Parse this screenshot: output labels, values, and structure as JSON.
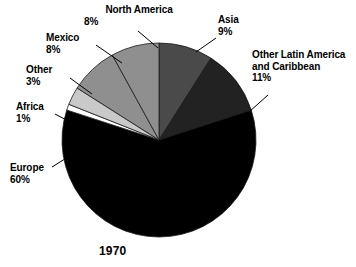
{
  "chart_data": {
    "type": "pie",
    "title": "1970",
    "xlabel": "",
    "ylabel": "",
    "legend_position": "none",
    "grid": false,
    "start_angle_deg": 0,
    "direction": "clockwise",
    "categories": [
      "Asia",
      "Other Latin America and Caribbean",
      "Europe",
      "Africa",
      "Other",
      "Mexico",
      "North America"
    ],
    "values": [
      9,
      11,
      60,
      1,
      3,
      8,
      8
    ],
    "value_unit": "%",
    "colors": [
      "#4a4a4a",
      "#222222",
      "#000000",
      "#ffffff",
      "#c9c9c9",
      "#8f8f8f",
      "#8f8f8f"
    ],
    "slices": [
      {
        "name": "Asia",
        "label_line1": "Asia",
        "label_line2": "",
        "value": 9,
        "value_label": "9%",
        "color": "#4a4a4a"
      },
      {
        "name": "Other Latin America and Caribbean",
        "label_line1": "Other Latin America",
        "label_line2": "and Caribbean",
        "value": 11,
        "value_label": "11%",
        "color": "#222222"
      },
      {
        "name": "Europe",
        "label_line1": "Europe",
        "label_line2": "",
        "value": 60,
        "value_label": "60%",
        "color": "#000000"
      },
      {
        "name": "Africa",
        "label_line1": "Africa",
        "label_line2": "",
        "value": 1,
        "value_label": "1%",
        "color": "#ffffff"
      },
      {
        "name": "Other",
        "label_line1": "Other",
        "label_line2": "",
        "value": 3,
        "value_label": "3%",
        "color": "#c9c9c9"
      },
      {
        "name": "Mexico",
        "label_line1": "Mexico",
        "label_line2": "",
        "value": 8,
        "value_label": "8%",
        "color": "#8f8f8f"
      },
      {
        "name": "North America",
        "label_line1": "North America",
        "label_line2": "",
        "value": 8,
        "value_label": "8%",
        "color": "#8f8f8f"
      }
    ]
  }
}
